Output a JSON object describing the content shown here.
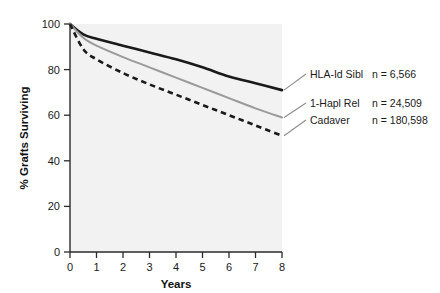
{
  "chart_data": {
    "type": "line",
    "title": "",
    "xlabel": "Years",
    "ylabel": "% Grafts Surviving",
    "xlim": [
      0,
      8
    ],
    "ylim": [
      0,
      100
    ],
    "xticks": [
      "0",
      "1",
      "2",
      "3",
      "4",
      "5",
      "6",
      "7",
      "8"
    ],
    "yticks": [
      "0",
      "20",
      "40",
      "60",
      "80",
      "100"
    ],
    "grid": false,
    "legend_position": "right-inline",
    "x": [
      0,
      0.5,
      1,
      2,
      3,
      4,
      5,
      6,
      7,
      8
    ],
    "series": [
      {
        "name": "HLA-Id Sibl",
        "n_label": "n = 6,566",
        "n_value": 6566,
        "style": "solid",
        "color": "#1a1a1a",
        "width": 2.6,
        "values": [
          100,
          95.5,
          93.5,
          90.5,
          87.5,
          84.5,
          81,
          77,
          74,
          71
        ]
      },
      {
        "name": "1-Hapl Rel",
        "n_label": "n = 24,509",
        "n_value": 24509,
        "style": "solid",
        "color": "#9a9a9a",
        "width": 2.0,
        "values": [
          100,
          94,
          90.5,
          85.5,
          81,
          76.5,
          72,
          67.5,
          63,
          59
        ]
      },
      {
        "name": "Cadaver",
        "n_label": "n = 180,598",
        "n_value": 180598,
        "style": "dashed",
        "color": "#1a1a1a",
        "width": 2.6,
        "values": [
          100,
          89,
          84.5,
          78.5,
          73.5,
          69,
          64.5,
          60,
          55.5,
          51
        ]
      }
    ]
  },
  "colors": {
    "plot_background": "#f2f2f2",
    "axis": "#2a2a2a",
    "text": "#1a1a1a",
    "leader_line": "#8c8c8c",
    "page_background": "#ffffff"
  }
}
